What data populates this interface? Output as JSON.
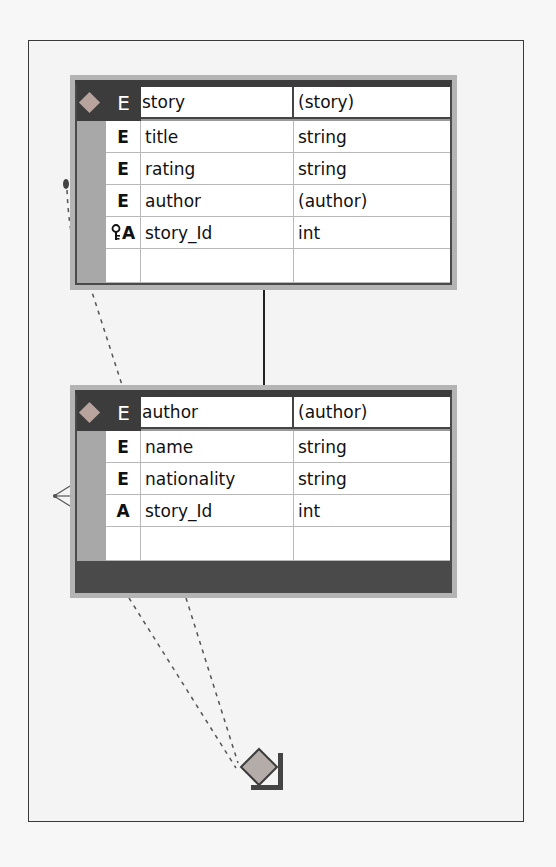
{
  "diagram": {
    "type": "xml-schema-design-view",
    "entities": [
      {
        "id": "story",
        "header": {
          "kind": "E",
          "name": "story",
          "type": "(story)",
          "icon": "diamond-icon"
        },
        "rows": [
          {
            "kind": "E",
            "name": "title",
            "type": "string",
            "icon": "element-icon"
          },
          {
            "kind": "E",
            "name": "rating",
            "type": "string",
            "icon": "element-icon"
          },
          {
            "kind": "E",
            "name": "author",
            "type": "(author)",
            "icon": "element-icon"
          },
          {
            "kind": "A",
            "name": "story_Id",
            "type": "int",
            "icon": "key-attribute-icon"
          },
          {
            "kind": "",
            "name": "",
            "type": "",
            "icon": ""
          }
        ]
      },
      {
        "id": "author",
        "header": {
          "kind": "E",
          "name": "author",
          "type": "(author)",
          "icon": "diamond-icon"
        },
        "rows": [
          {
            "kind": "E",
            "name": "name",
            "type": "string",
            "icon": "element-icon"
          },
          {
            "kind": "E",
            "name": "nationality",
            "type": "string",
            "icon": "element-icon"
          },
          {
            "kind": "A",
            "name": "story_Id",
            "type": "int",
            "icon": "attribute-icon"
          },
          {
            "kind": "",
            "name": "",
            "type": "",
            "icon": ""
          }
        ]
      }
    ],
    "relations": [
      {
        "from": "story",
        "to": "author",
        "style": "solid",
        "name": "nesting-connector"
      },
      {
        "from": "story",
        "to": "author",
        "style": "dashed",
        "end": "crows-foot",
        "name": "key-relation"
      },
      {
        "from": "author",
        "to": "group-anchor",
        "style": "dashed",
        "name": "group-link"
      }
    ],
    "colors": {
      "header": "#3c3c3c",
      "frame": "#b4b4b4",
      "gutter": "#a8a8a8",
      "diamond": "#b9a49d",
      "canvas": "#f4f4f4"
    }
  }
}
